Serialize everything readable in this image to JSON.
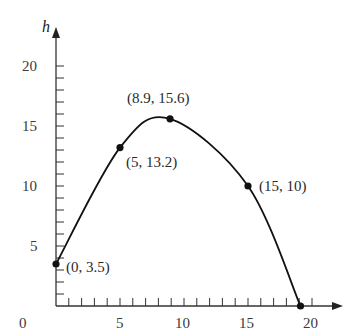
{
  "chart_data": {
    "type": "line",
    "title": "",
    "xlabel": "",
    "ylabel": "h",
    "xlim": [
      0,
      22
    ],
    "ylim": [
      0,
      22
    ],
    "x_ticks": [
      0,
      5,
      10,
      15,
      20
    ],
    "y_ticks": [
      5,
      10,
      15,
      20
    ],
    "x_tick_labels": [
      "0",
      "5",
      "10",
      "15",
      "20"
    ],
    "y_tick_labels": [
      "5",
      "10",
      "15",
      "20"
    ],
    "minor_tick_step": 1,
    "grid": false,
    "legend": null,
    "series": [
      {
        "name": "h",
        "x": [
          0,
          5,
          8.9,
          15,
          19.1
        ],
        "y": [
          3.5,
          13.2,
          15.6,
          10,
          0
        ],
        "smooth": true
      }
    ],
    "labeled_points": [
      {
        "x": 0,
        "y": 3.5,
        "label": "(0, 3.5)"
      },
      {
        "x": 5,
        "y": 13.2,
        "label": "(5, 13.2)"
      },
      {
        "x": 8.9,
        "y": 15.6,
        "label": "(8.9, 15.6)"
      },
      {
        "x": 15,
        "y": 10,
        "label": "(15, 10)"
      },
      {
        "x": 19.1,
        "y": 0,
        "label": ""
      }
    ]
  },
  "axes": {
    "y_var": "h",
    "x_tick_labels": [
      "0",
      "5",
      "10",
      "15",
      "20"
    ],
    "y_tick_labels": [
      "5",
      "10",
      "15",
      "20"
    ]
  },
  "points": {
    "p0": "(0, 3.5)",
    "p1": "(5, 13.2)",
    "p2": "(8.9, 15.6)",
    "p3": "(15, 10)"
  }
}
